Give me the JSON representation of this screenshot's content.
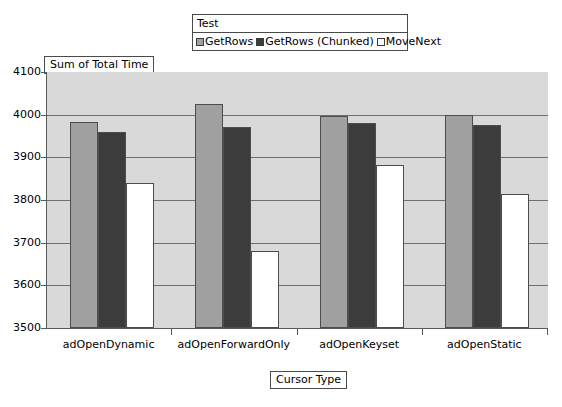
{
  "legend": {
    "title": "Test",
    "entries": [
      {
        "label": "GetRows",
        "color": "#a0a0a0"
      },
      {
        "label": "GetRows (Chunked)",
        "color": "#3c3c3c"
      },
      {
        "label": "MoveNext",
        "color": "#ffffff"
      }
    ]
  },
  "axes": {
    "y_title": "Sum of Total Time",
    "x_title": "Cursor Type"
  },
  "chart_data": {
    "type": "bar",
    "title": "",
    "subtitle": "",
    "xlabel": "Cursor Type",
    "ylabel": "Sum of Total Time",
    "categories": [
      "adOpenDynamic",
      "adOpenForwardOnly",
      "adOpenKeyset",
      "adOpenStatic"
    ],
    "series": [
      {
        "name": "GetRows",
        "color": "#a0a0a0",
        "values": [
          3982,
          4025,
          3997,
          4000
        ]
      },
      {
        "name": "GetRows (Chunked)",
        "color": "#3c3c3c",
        "values": [
          3960,
          3970,
          3980,
          3975
        ]
      },
      {
        "name": "MoveNext",
        "color": "#ffffff",
        "values": [
          3840,
          3680,
          3883,
          3815
        ]
      }
    ],
    "ylim": [
      3500,
      4100
    ],
    "yticks": [
      3500,
      3600,
      3700,
      3800,
      3900,
      4000,
      4100
    ],
    "ytick_labels": [
      "3500",
      "3600",
      "3700",
      "3800",
      "3900",
      "4000",
      "4100"
    ],
    "grid": true,
    "grid_axis": "y",
    "legend_position": "top-center",
    "legend_title": "Test",
    "plot_background": "#d9d9d9"
  }
}
